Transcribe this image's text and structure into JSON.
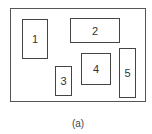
{
  "diagram": {
    "caption": "(a)",
    "blocks": [
      {
        "label": "1",
        "x": 22,
        "y": 19,
        "w": 26,
        "h": 40
      },
      {
        "label": "2",
        "x": 70,
        "y": 18,
        "w": 50,
        "h": 25
      },
      {
        "label": "3",
        "x": 55,
        "y": 66,
        "w": 17,
        "h": 30
      },
      {
        "label": "4",
        "x": 81,
        "y": 53,
        "w": 30,
        "h": 32
      },
      {
        "label": "5",
        "x": 119,
        "y": 48,
        "w": 17,
        "h": 50
      }
    ]
  }
}
